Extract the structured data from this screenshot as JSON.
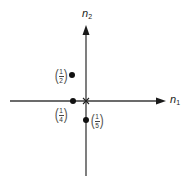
{
  "diagram": {
    "type": "coordinate-plane",
    "axes": {
      "horizontal": {
        "label_base": "n",
        "label_sub": "1"
      },
      "vertical": {
        "label_base": "n",
        "label_sub": "2"
      }
    },
    "origin_marker": "x",
    "points": [
      {
        "id": "p-half",
        "num": "1",
        "den": "2",
        "position": "upper-left quadrant, left of vertical axis"
      },
      {
        "id": "p-quarter",
        "num": "1",
        "den": "4",
        "position": "on negative n1 axis"
      },
      {
        "id": "p-fifth",
        "num": "1",
        "den": "5",
        "position": "on negative n2 axis"
      }
    ],
    "colors": {
      "axis": "#3a3a3a",
      "point": "#111111",
      "background": "#ffffff"
    }
  }
}
